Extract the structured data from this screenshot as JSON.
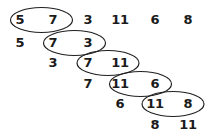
{
  "diagram": {
    "stroke_color": "#1f1f1f",
    "text_color": "#1b1b1b",
    "background_color": "#ffffff",
    "columns_x": [
      20,
      53,
      88,
      120,
      155,
      188
    ],
    "row_font_size": 13,
    "rows": [
      {
        "id": "row-1",
        "y": 20,
        "cells": [
          {
            "value": "5",
            "col": 0
          },
          {
            "value": "7",
            "col": 1
          },
          {
            "value": "3",
            "col": 2
          },
          {
            "value": "11",
            "col": 3
          },
          {
            "value": "6",
            "col": 4
          },
          {
            "value": "8",
            "col": 5
          }
        ],
        "circled_pair": [
          0,
          1
        ]
      },
      {
        "id": "row-2",
        "y": 43,
        "cells": [
          {
            "value": "5",
            "col": 0
          },
          {
            "value": "7",
            "col": 1
          },
          {
            "value": "3",
            "col": 2
          }
        ],
        "circled_pair": [
          1,
          2
        ]
      },
      {
        "id": "row-3",
        "y": 63,
        "cells": [
          {
            "value": "3",
            "col": 1
          },
          {
            "value": "7",
            "col": 2
          },
          {
            "value": "11",
            "col": 3
          }
        ],
        "circled_pair": [
          2,
          3
        ]
      },
      {
        "id": "row-4",
        "y": 84,
        "cells": [
          {
            "value": "7",
            "col": 2
          },
          {
            "value": "11",
            "col": 3
          },
          {
            "value": "6",
            "col": 4
          }
        ],
        "circled_pair": [
          3,
          4
        ]
      },
      {
        "id": "row-5",
        "y": 104,
        "cells": [
          {
            "value": "6",
            "col": 3
          },
          {
            "value": "11",
            "col": 4
          },
          {
            "value": "8",
            "col": 5
          }
        ],
        "circled_pair": [
          4,
          5
        ]
      },
      {
        "id": "row-6",
        "y": 125,
        "cells": [
          {
            "value": "8",
            "col": 4
          },
          {
            "value": "11",
            "col": 5
          }
        ],
        "circled_pair": null
      }
    ],
    "ellipses": [
      {
        "id": "ellipse-5-7",
        "cx": 41.5,
        "cy": 20,
        "rx": 31,
        "ry": 12.5
      },
      {
        "id": "ellipse-7-3",
        "cx": 74.5,
        "cy": 43,
        "rx": 31,
        "ry": 12.5
      },
      {
        "id": "ellipse-7-11",
        "cx": 108,
        "cy": 63,
        "rx": 31,
        "ry": 12.5
      },
      {
        "id": "ellipse-11-6",
        "cx": 140.5,
        "cy": 84,
        "rx": 31,
        "ry": 12.5
      },
      {
        "id": "ellipse-11-8",
        "cx": 173,
        "cy": 104,
        "rx": 31,
        "ry": 12.5
      }
    ]
  }
}
